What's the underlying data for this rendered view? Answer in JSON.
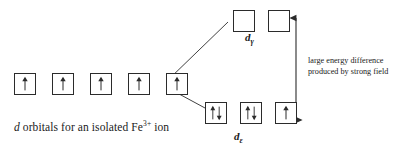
{
  "diagram": {
    "type": "crystal-field-splitting",
    "background_color": "#ffffff",
    "line_color": "#2b2b2b",
    "free_ion": {
      "caption_before": "d",
      "caption_after": " orbitals for an isolated Fe",
      "caption_superscript": "3+",
      "caption_end": " ion",
      "orbital_count": 5,
      "orbitals": [
        {
          "electrons": "up"
        },
        {
          "electrons": "up"
        },
        {
          "electrons": "up"
        },
        {
          "electrons": "up"
        },
        {
          "electrons": "up"
        }
      ]
    },
    "upper_level": {
      "label_letter": "d",
      "label_subscript": "γ",
      "orbital_count": 2,
      "orbitals": [
        {
          "electrons": "empty"
        },
        {
          "electrons": "empty"
        }
      ]
    },
    "lower_level": {
      "label_letter": "d",
      "label_subscript": "ε",
      "orbital_count": 3,
      "orbitals": [
        {
          "electrons": "pair"
        },
        {
          "electrons": "pair"
        },
        {
          "electrons": "up"
        }
      ]
    },
    "energy_arrow": {
      "style": "double-headed-vertical",
      "annotation_line_1": "large energy difference",
      "annotation_line_2": "produced by strong field"
    }
  }
}
